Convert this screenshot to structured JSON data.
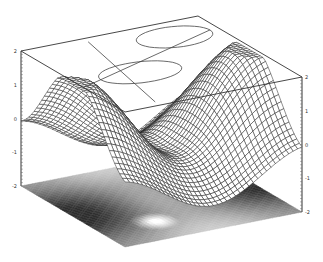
{
  "chart_data": {
    "type": "surface3d",
    "title": "",
    "xlabel": "",
    "ylabel": "",
    "zlabel": "",
    "zlim": [
      -2,
      2
    ],
    "z_ticks": [
      "2",
      "1",
      "0",
      "-1",
      "-2"
    ],
    "grid": false,
    "grid_resolution": 40,
    "surface_function": "z = 1.5*cos(pi*u)*... wave saddle with central dip",
    "projections": {
      "top": "contour",
      "bottom": "grayscale-shaded"
    },
    "colors": {
      "mesh": "#222222",
      "box": "#333333",
      "contour": "#444444",
      "shade_dark": "#1a1a1a",
      "shade_light": "#ffffff"
    }
  },
  "axes": {
    "left_ticks": [
      "2",
      "1",
      "0",
      "-1",
      "-2"
    ],
    "right_ticks": [
      "2",
      "1",
      "0",
      "-1",
      "-2"
    ]
  }
}
